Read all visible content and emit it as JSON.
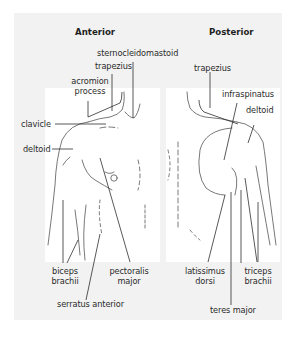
{
  "diagram": {
    "views": [
      {
        "title": "Anterior",
        "labels": {
          "sternocleidomastoid": "sternocleidomastoid",
          "trapezius": "trapezius",
          "acromion_1": "acromion",
          "acromion_2": "process",
          "clavicle": "clavicle",
          "deltoid": "deltoid",
          "biceps_1": "biceps",
          "biceps_2": "brachii",
          "pectoralis_1": "pectoralis",
          "pectoralis_2": "major",
          "serratus": "serratus anterior"
        }
      },
      {
        "title": "Posterior",
        "labels": {
          "trapezius": "trapezius",
          "infraspinatus": "infraspinatus",
          "deltoid": "deltoid",
          "latissimus_1": "latissimus",
          "latissimus_2": "dorsi",
          "triceps_1": "triceps",
          "triceps_2": "brachii",
          "teres": "teres major"
        }
      }
    ],
    "colors": {
      "panel": "#f2f2f2",
      "figure": "#ffffff",
      "line": "#333333"
    }
  }
}
